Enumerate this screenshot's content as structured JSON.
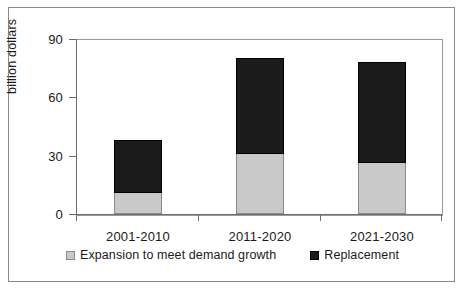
{
  "chart_data": {
    "type": "bar",
    "subtype": "stacked-bar",
    "title": "",
    "xlabel": "",
    "ylabel": "billion dollars",
    "ylim": [
      0,
      90
    ],
    "yticks": [
      0,
      30,
      60,
      90
    ],
    "ytick_labels": [
      "0",
      "30",
      "60",
      "90"
    ],
    "grid": false,
    "categories": [
      "2001-2010",
      "2011-2020",
      "2021-2030"
    ],
    "series": [
      {
        "name": "Expansion to meet demand growth",
        "color": "#c9c9c9",
        "values": [
          11,
          31,
          26
        ]
      },
      {
        "name": "Replacement",
        "color": "#1c1c1c",
        "values": [
          27,
          49,
          52
        ]
      }
    ],
    "totals": [
      38,
      80,
      78
    ],
    "legend_position": "bottom",
    "annotations": []
  },
  "axis": {
    "y_title": "billion dollars",
    "ticks": [
      {
        "label": "90",
        "value": 90
      },
      {
        "label": "60",
        "value": 60
      },
      {
        "label": "30",
        "value": 30
      },
      {
        "label": "0",
        "value": 0
      }
    ]
  },
  "legend": {
    "entries": [
      {
        "label": "Expansion to meet demand growth",
        "swatch": "gray-square-icon"
      },
      {
        "label": "Replacement",
        "swatch": "black-square-icon"
      }
    ]
  }
}
